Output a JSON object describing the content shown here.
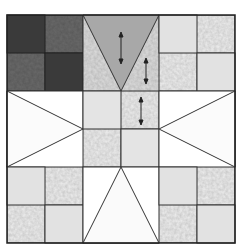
{
  "image": {
    "subject": "quilt-block",
    "description": "Nine-patch star quilt block with four-patch corners, flying-geese style sides and a four-patch center",
    "colors": {
      "background": "#ffffff",
      "line": "#333333",
      "dark": "#3a3a3a",
      "dark_texture": "#5a5a5a",
      "mid_gray": "#a8a8a8",
      "light_gray": "#dcdcdc",
      "very_light": "#ececec",
      "white": "#ffffff"
    },
    "annotations": {
      "arrows": 3,
      "arrow_glyph": "double-headed vertical arrow"
    }
  }
}
